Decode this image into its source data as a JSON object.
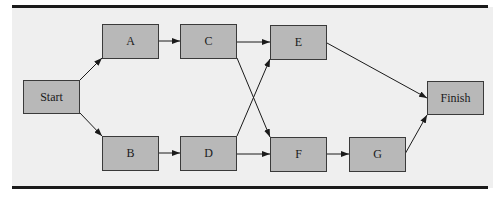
{
  "diagram": {
    "type": "activity-network",
    "nodes": [
      {
        "id": "start",
        "label": "Start"
      },
      {
        "id": "a",
        "label": "A"
      },
      {
        "id": "b",
        "label": "B"
      },
      {
        "id": "c",
        "label": "C"
      },
      {
        "id": "d",
        "label": "D"
      },
      {
        "id": "e",
        "label": "E"
      },
      {
        "id": "f",
        "label": "F"
      },
      {
        "id": "g",
        "label": "G"
      },
      {
        "id": "finish",
        "label": "Finish"
      }
    ],
    "edges": [
      {
        "from": "Start",
        "to": "A"
      },
      {
        "from": "Start",
        "to": "B"
      },
      {
        "from": "A",
        "to": "C"
      },
      {
        "from": "B",
        "to": "D"
      },
      {
        "from": "C",
        "to": "E"
      },
      {
        "from": "C",
        "to": "F"
      },
      {
        "from": "D",
        "to": "E"
      },
      {
        "from": "D",
        "to": "F"
      },
      {
        "from": "E",
        "to": "Finish"
      },
      {
        "from": "F",
        "to": "G"
      },
      {
        "from": "G",
        "to": "Finish"
      }
    ]
  },
  "colors": {
    "node_fill": "#b8b8b8",
    "node_border": "#3a3a3a",
    "background": "#efefef",
    "rule": "#1a1a1a"
  }
}
